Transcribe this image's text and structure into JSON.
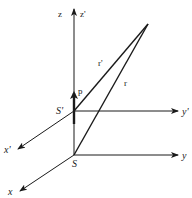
{
  "diagram": {
    "title": "",
    "frames": {
      "S": {
        "origin_label": "S",
        "axes": {
          "x": "x",
          "y": "y",
          "z": "z"
        }
      },
      "S_prime": {
        "origin_label": "S'",
        "axes": {
          "x": "x'",
          "y": "y'",
          "z": "z'"
        }
      }
    },
    "vectors": {
      "r": "r",
      "r_prime": "r'",
      "p": "p"
    },
    "colors": {
      "stroke": "#1a1a1a",
      "background": "#ffffff"
    }
  }
}
